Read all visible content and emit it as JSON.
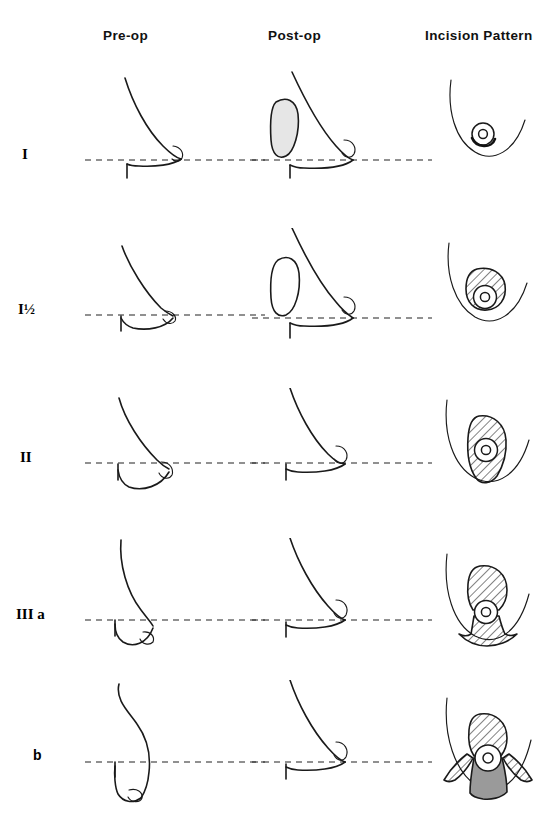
{
  "figure": {
    "background_color": "#ffffff",
    "ink_color": "#1a1a1a",
    "implant_shade_color": "#e6e6e6",
    "pedicle_shade_color": "#9a9a9a"
  },
  "columns": [
    {
      "key": "preop",
      "label": "Pre-op"
    },
    {
      "key": "postop",
      "label": "Post-op"
    },
    {
      "key": "incision",
      "label": "Incision Pattern"
    }
  ],
  "rows": [
    {
      "id": "grade-1",
      "label": "I",
      "label_style": "serif",
      "fold_line_y": 160,
      "preop": {
        "ptosis_note": "nipple at inframammary fold level",
        "nipple_below_fold_px": 0,
        "implant": "none"
      },
      "postop": {
        "implant": "shaded",
        "implant_fill": "#e6e6e6",
        "nipple_above_fold_px": 18
      },
      "incision": {
        "pattern": "periareolar",
        "hatched_regions": 0,
        "has_dark_arc": true,
        "has_gray_pedicle": false,
        "areola_size": "small"
      }
    },
    {
      "id": "grade-1-half",
      "label": "I½",
      "label_style": "serif",
      "fold_line_y": 315,
      "preop": {
        "ptosis_note": "nipple at fold, tissue just below",
        "nipple_below_fold_px": 2,
        "implant": "none"
      },
      "postop": {
        "implant": "outline",
        "implant_fill": "#ffffff",
        "nipple_above_fold_px": 22
      },
      "incision": {
        "pattern": "crescent / periareolar with superior hatch",
        "hatched_regions": 1,
        "has_dark_arc": false,
        "has_gray_pedicle": false,
        "areola_size": "medium"
      }
    },
    {
      "id": "grade-2",
      "label": "II",
      "label_style": "serif",
      "fold_line_y": 463,
      "preop": {
        "ptosis_note": "nipple at fold, increased ptosis of tissue",
        "nipple_below_fold_px": 6,
        "implant": "none"
      },
      "postop": {
        "implant": "none",
        "implant_fill": "#ffffff",
        "nipple_above_fold_px": 26
      },
      "incision": {
        "pattern": "vertical keyhole",
        "hatched_regions": 1,
        "has_dark_arc": false,
        "has_gray_pedicle": false,
        "areola_size": "medium"
      }
    },
    {
      "id": "grade-3a",
      "label": "III a",
      "label_style": "serif",
      "fold_line_y": 620,
      "preop": {
        "ptosis_note": "nipple clearly below inframammary fold",
        "nipple_below_fold_px": 18,
        "implant": "none"
      },
      "postop": {
        "implant": "none",
        "implant_fill": "#ffffff",
        "nipple_above_fold_px": 30
      },
      "incision": {
        "pattern": "keyhole with inframammary extension",
        "hatched_regions": 2,
        "has_dark_arc": false,
        "has_gray_pedicle": false,
        "areola_size": "medium"
      }
    },
    {
      "id": "grade-3b",
      "label": "b",
      "label_style": "sans",
      "fold_line_y": 760,
      "preop": {
        "ptosis_note": "severe ptosis, nipple far below fold",
        "nipple_below_fold_px": 42,
        "implant": "none"
      },
      "postop": {
        "implant": "none",
        "implant_fill": "#ffffff",
        "nipple_above_fold_px": 34
      },
      "incision": {
        "pattern": "inverted-T with inferior pedicle",
        "hatched_regions": 3,
        "has_dark_arc": false,
        "has_gray_pedicle": true,
        "areola_size": "medium"
      }
    }
  ]
}
